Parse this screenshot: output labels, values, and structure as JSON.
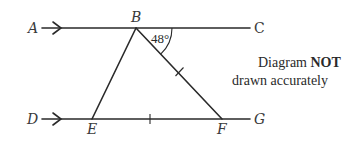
{
  "diagram": {
    "points": {
      "A": {
        "label": "A"
      },
      "B": {
        "label": "B"
      },
      "C": {
        "label": "C"
      },
      "D": {
        "label": "D"
      },
      "E": {
        "label": "E"
      },
      "F": {
        "label": "F"
      },
      "G": {
        "label": "G"
      }
    },
    "angle_label": "48°",
    "note": {
      "line1_prefix": "Diagram ",
      "line1_bold": "NOT",
      "line2": "drawn accurately"
    },
    "lines": [
      {
        "name": "AC",
        "parallel_marker": "single-arrow"
      },
      {
        "name": "DG",
        "parallel_marker": "single-arrow"
      },
      {
        "name": "BE"
      },
      {
        "name": "BF",
        "equal_marker": "single-tick"
      },
      {
        "name": "EF",
        "equal_marker": "single-tick"
      }
    ],
    "colors": {
      "stroke": "#2a2a2a",
      "text": "#3a3a3a",
      "background": "#ffffff"
    }
  }
}
